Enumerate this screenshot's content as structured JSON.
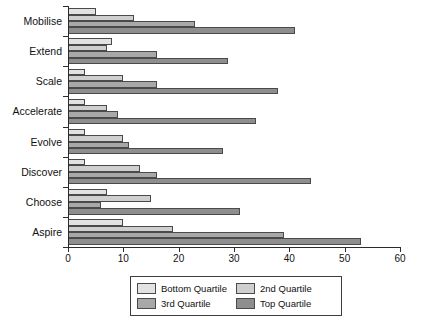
{
  "chart_data": {
    "type": "bar",
    "orientation": "horizontal",
    "title": "",
    "xlabel": "",
    "ylabel": "",
    "xlim": [
      0,
      60
    ],
    "xticks": [
      0,
      10,
      20,
      30,
      40,
      50,
      60
    ],
    "grid": false,
    "legend_position": "bottom-center",
    "categories": [
      "Mobilise",
      "Extend",
      "Scale",
      "Accelerate",
      "Evolve",
      "Discover",
      "Choose",
      "Aspire"
    ],
    "series": [
      {
        "name": "Bottom Quartile",
        "color": "#e2e2e2",
        "values": [
          5,
          8,
          3,
          3,
          3,
          3,
          7,
          10
        ]
      },
      {
        "name": "2nd Quartile",
        "color": "#cfcfcf",
        "values": [
          12,
          7,
          10,
          7,
          10,
          13,
          15,
          19
        ]
      },
      {
        "name": "3rd Quartile",
        "color": "#a8a8a8",
        "values": [
          23,
          16,
          16,
          9,
          11,
          16,
          6,
          39
        ]
      },
      {
        "name": "Top Quartile",
        "color": "#8e8e8e",
        "values": [
          41,
          29,
          38,
          34,
          28,
          44,
          31,
          53
        ]
      }
    ]
  },
  "legend": {
    "entries": [
      {
        "label": "Bottom Quartile",
        "key": "q1"
      },
      {
        "label": "2nd Quartile",
        "key": "q2"
      },
      {
        "label": "3rd Quartile",
        "key": "q3"
      },
      {
        "label": "Top Quartile",
        "key": "q4"
      }
    ]
  }
}
